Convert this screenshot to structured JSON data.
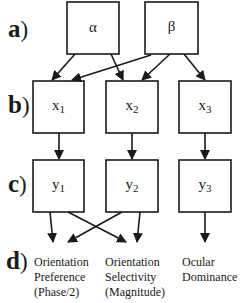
{
  "diagram": {
    "row_labels": [
      {
        "letter": "a",
        "paren": ")"
      },
      {
        "letter": "b",
        "paren": ")"
      },
      {
        "letter": "c",
        "paren": ")"
      },
      {
        "letter": "d",
        "paren": ")"
      }
    ],
    "nodes": {
      "alpha": {
        "symbol": "α"
      },
      "beta": {
        "symbol": "β"
      },
      "x1": {
        "base": "x",
        "sub": "1"
      },
      "x2": {
        "base": "x",
        "sub": "2"
      },
      "x3": {
        "base": "x",
        "sub": "3"
      },
      "y1": {
        "base": "y",
        "sub": "1"
      },
      "y2": {
        "base": "y",
        "sub": "2"
      },
      "y3": {
        "base": "y",
        "sub": "3"
      }
    },
    "outputs": [
      {
        "line1": "Orientation",
        "line2": "Preference",
        "line3": "(Phase/2)"
      },
      {
        "line1": "Orientation",
        "line2": "Selectivity",
        "line3": "(Magnitude)"
      },
      {
        "line1": "Ocular",
        "line2": "Dominance",
        "line3": ""
      }
    ],
    "edges": [
      {
        "from": "alpha",
        "to": "x1"
      },
      {
        "from": "alpha",
        "to": "x2"
      },
      {
        "from": "beta",
        "to": "x1"
      },
      {
        "from": "beta",
        "to": "x2"
      },
      {
        "from": "beta",
        "to": "x3"
      },
      {
        "from": "x1",
        "to": "y1"
      },
      {
        "from": "x2",
        "to": "y2"
      },
      {
        "from": "x3",
        "to": "y3"
      },
      {
        "from": "y1",
        "to": "Orientation Preference"
      },
      {
        "from": "y1",
        "to": "Orientation Selectivity"
      },
      {
        "from": "y2",
        "to": "Orientation Preference"
      },
      {
        "from": "y2",
        "to": "Orientation Selectivity"
      },
      {
        "from": "y3",
        "to": "Ocular Dominance"
      }
    ],
    "colors": {
      "stroke": "#1a1a1a",
      "background": "#ffffff"
    }
  }
}
